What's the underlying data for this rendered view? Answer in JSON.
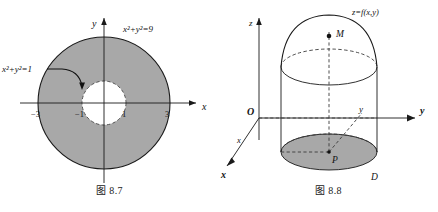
{
  "page": {
    "background_color": "#ffffff",
    "text_color": "#111111",
    "shade_color": "#a8a8a8",
    "stroke_color": "#1a1a1a"
  },
  "figure_left": {
    "caption": "图 8.7",
    "axis_x_label": "x",
    "axis_y_label": "y",
    "outer_circle_label": "x²+y²=9",
    "inner_circle_label": "x²+y²=1",
    "ticks": [
      {
        "label": "−3",
        "value": -3
      },
      {
        "label": "−1",
        "value": -1
      },
      {
        "label": "1",
        "value": 1
      },
      {
        "label": "3",
        "value": 3
      }
    ],
    "region": {
      "type": "annulus",
      "outer_radius": 3,
      "inner_radius": 1,
      "outer_style": "solid",
      "inner_style": "dashed",
      "fill": "#a8a8a8"
    }
  },
  "figure_right": {
    "caption": "图 8.8",
    "surface_label": "z=f(x,y)",
    "axis_z_label": "z",
    "axis_y_label": "y",
    "axis_x_label": "x",
    "axis_x_inner_label": "x",
    "axis_y_inner_label": "y",
    "origin_label": "O",
    "point_m_label": "M",
    "point_p_label": "P",
    "domain_label": "D",
    "solid_description": "cylinder with domed top surface over region D",
    "base_fill": "#a8a8a8"
  }
}
